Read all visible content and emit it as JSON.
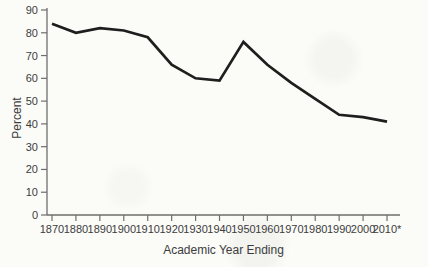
{
  "figure": {
    "background_color": "#fbfbf8",
    "axis_color": "#6e6e6e",
    "text_color": "#3c3c3c",
    "line_color": "#1e1e1e"
  },
  "chart_data": {
    "type": "line",
    "title": "",
    "xlabel": "Academic Year Ending",
    "ylabel": "Percent",
    "categories": [
      "1870",
      "1880",
      "1890",
      "1900",
      "1910",
      "1920",
      "1930",
      "1940",
      "1950",
      "1960",
      "1970",
      "1980",
      "1990",
      "2000",
      "2010*"
    ],
    "values": [
      84,
      80,
      82,
      81,
      78,
      66,
      60,
      59,
      76,
      66,
      58,
      51,
      44,
      43,
      41
    ],
    "ylim": [
      0,
      90
    ],
    "ytick_step": 10,
    "yticks": [
      0,
      10,
      20,
      30,
      40,
      50,
      60,
      70,
      80,
      90
    ],
    "grid": false,
    "legend": null
  }
}
